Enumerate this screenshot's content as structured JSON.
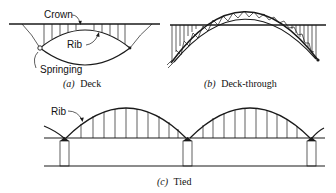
{
  "figure": {
    "panels": [
      {
        "id": "a",
        "caption_letter": "(a)",
        "caption_text": "Deck",
        "labels": {
          "crown": "Crown",
          "rib": "Rib",
          "springing": "Springing"
        }
      },
      {
        "id": "b",
        "caption_letter": "(b)",
        "caption_text": "Deck-through"
      },
      {
        "id": "c",
        "caption_letter": "(c)",
        "caption_text": "Tied",
        "labels": {
          "rib": "Rib"
        }
      }
    ]
  },
  "colors": {
    "ink": "#1a1a1a",
    "background": "#ffffff"
  }
}
